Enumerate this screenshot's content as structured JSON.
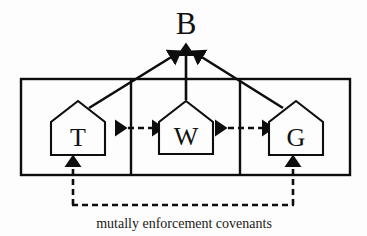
{
  "diagram": {
    "type": "block-diagram",
    "background_color": "#fdfdfd",
    "line_color": "#0d0d0d",
    "top_node": {
      "label": "B",
      "name": "bank-node"
    },
    "caption": {
      "text": "mutally enforcement covenants"
    },
    "houses": [
      {
        "label": "T",
        "name": "house-t"
      },
      {
        "label": "W",
        "name": "house-w"
      },
      {
        "label": "G",
        "name": "house-g"
      }
    ],
    "connections": [
      {
        "from": "T",
        "to": "B",
        "style": "solid",
        "heads": "single"
      },
      {
        "from": "W",
        "to": "B",
        "style": "solid",
        "heads": "single"
      },
      {
        "from": "G",
        "to": "B",
        "style": "solid",
        "heads": "single"
      },
      {
        "from": "T",
        "to": "W",
        "style": "dashed",
        "heads": "double"
      },
      {
        "from": "W",
        "to": "G",
        "style": "dashed",
        "heads": "double"
      },
      {
        "from": "covenant-path",
        "to": "T",
        "style": "dashed",
        "heads": "single"
      },
      {
        "from": "covenant-path",
        "to": "G",
        "style": "dashed",
        "heads": "single"
      }
    ]
  }
}
